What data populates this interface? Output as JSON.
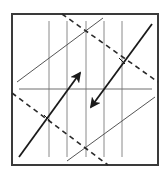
{
  "diagram": {
    "width": 166,
    "height": 172,
    "background": "#ffffff",
    "frame": {
      "x": 12,
      "y": 14,
      "w": 146,
      "h": 151,
      "stroke": "#3a3a3a",
      "stroke_width": 2
    },
    "vertical_lines": {
      "stroke": "#8a8a8a",
      "stroke_width": 1,
      "y1": 21,
      "y2": 157,
      "x": [
        49,
        67,
        86,
        104,
        122
      ]
    },
    "horizontal_line": {
      "x1": 19,
      "y1": 89,
      "x2": 152,
      "y2": 89,
      "stroke": "#6e6e6e",
      "stroke_width": 1
    },
    "thin_diagonals": [
      {
        "name": "upper-thin-diagonal",
        "x1": 17,
        "y1": 82,
        "x2": 103,
        "y2": 18,
        "stroke": "#555555",
        "stroke_width": 1
      },
      {
        "name": "lower-thin-diagonal",
        "x1": 67,
        "y1": 161,
        "x2": 155,
        "y2": 97,
        "stroke": "#555555",
        "stroke_width": 1
      }
    ],
    "dashed_lines": [
      {
        "name": "upper-dashed-line",
        "x1": 62,
        "y1": 14,
        "x2": 158,
        "y2": 82,
        "stroke": "#2a2a2a",
        "stroke_width": 1.6,
        "dash": "5,4"
      },
      {
        "name": "lower-dashed-line",
        "x1": 12,
        "y1": 93,
        "x2": 108,
        "y2": 165,
        "stroke": "#2a2a2a",
        "stroke_width": 1.6,
        "dash": "5,4"
      }
    ],
    "arrows": [
      {
        "name": "arrow-up-right",
        "x1": 19,
        "y1": 157,
        "x2": 80,
        "y2": 73,
        "stroke": "#1a1a1a",
        "stroke_width": 1.8,
        "direction": "up-right"
      },
      {
        "name": "arrow-down-left",
        "x1": 152,
        "y1": 24,
        "x2": 91,
        "y2": 107,
        "stroke": "#1a1a1a",
        "stroke_width": 1.8,
        "direction": "down-left"
      }
    ],
    "tick_marks": [
      {
        "name": "tick-upper-intersection",
        "x1": 119,
        "y1": 58,
        "x2": 125,
        "y2": 64
      },
      {
        "name": "tick-lower-intersection",
        "x1": 44,
        "y1": 115,
        "x2": 50,
        "y2": 121
      }
    ]
  }
}
